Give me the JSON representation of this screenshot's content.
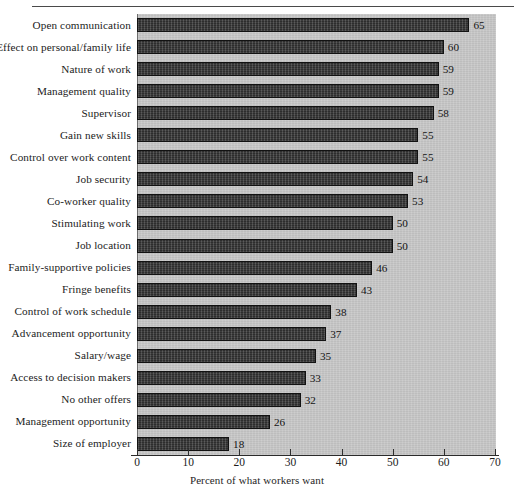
{
  "chart_data": {
    "type": "bar",
    "orientation": "horizontal",
    "title": "",
    "subtitle": "",
    "xlabel": "Percent of what workers want",
    "ylabel": "",
    "xlim": [
      0,
      70
    ],
    "xticks": [
      0,
      10,
      20,
      30,
      40,
      50,
      60,
      70
    ],
    "grid": false,
    "legend": null,
    "bar_color": "#3a3a3a",
    "plot_background": "#c9c9c9",
    "categories": [
      "Open communication",
      "Effect on personal/family life",
      "Nature of work",
      "Management quality",
      "Supervisor",
      "Gain new skills",
      "Control over work content",
      "Job security",
      "Co-worker quality",
      "Stimulating work",
      "Job location",
      "Family-supportive policies",
      "Fringe benefits",
      "Control of work schedule",
      "Advancement opportunity",
      "Salary/wage",
      "Access to decision makers",
      "No other offers",
      "Management opportunity",
      "Size of employer"
    ],
    "values": [
      65,
      60,
      59,
      59,
      58,
      55,
      55,
      54,
      53,
      50,
      50,
      46,
      43,
      38,
      37,
      35,
      33,
      32,
      26,
      18
    ],
    "data_labels": [
      "65",
      "60",
      "59",
      "59",
      "58",
      "55",
      "55",
      "54",
      "53",
      "50",
      "50",
      "46",
      "43",
      "38",
      "37",
      "35",
      "33",
      "32",
      "26",
      "18"
    ]
  },
  "figure": {
    "x_axis_title": "Percent of what workers want",
    "tick_labels": [
      "0",
      "10",
      "20",
      "30",
      "40",
      "50",
      "60",
      "70"
    ]
  }
}
